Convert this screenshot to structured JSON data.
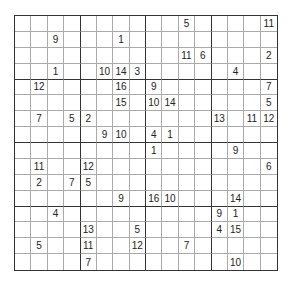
{
  "puzzle": {
    "type": "sudoku-16x16",
    "size": 16,
    "box_size": 4,
    "grid": [
      [
        "",
        "",
        "",
        "",
        "",
        "",
        "",
        "",
        "",
        "",
        "5",
        "",
        "",
        "",
        "",
        "11"
      ],
      [
        "",
        "",
        "9",
        "",
        "",
        "",
        "1",
        "",
        "",
        "",
        "",
        "",
        "",
        "",
        "",
        ""
      ],
      [
        "",
        "",
        "",
        "",
        "",
        "",
        "",
        "",
        "",
        "",
        "11",
        "6",
        "",
        "",
        "",
        "2"
      ],
      [
        "",
        "",
        "1",
        "",
        "",
        "10",
        "14",
        "3",
        "",
        "",
        "",
        "",
        "",
        "4",
        "",
        ""
      ],
      [
        "",
        "12",
        "",
        "",
        "",
        "",
        "16",
        "",
        "9",
        "",
        "",
        "",
        "",
        "",
        "",
        "7"
      ],
      [
        "",
        "",
        "",
        "",
        "",
        "",
        "15",
        "",
        "10",
        "14",
        "",
        "",
        "",
        "",
        "",
        "5"
      ],
      [
        "",
        "7",
        "",
        "5",
        "2",
        "",
        "",
        "",
        "",
        "",
        "",
        "",
        "13",
        "",
        "11",
        "12"
      ],
      [
        "",
        "",
        "",
        "",
        "",
        "9",
        "10",
        "",
        "4",
        "1",
        "",
        "",
        "",
        "",
        "",
        ""
      ],
      [
        "",
        "",
        "",
        "",
        "",
        "",
        "",
        "",
        "1",
        "",
        "",
        "",
        "",
        "9",
        "",
        ""
      ],
      [
        "",
        "11",
        "",
        "",
        "12",
        "",
        "",
        "",
        "",
        "",
        "",
        "",
        "",
        "",
        "",
        "6"
      ],
      [
        "",
        "2",
        "",
        "7",
        "5",
        "",
        "",
        "",
        "",
        "",
        "",
        "",
        "",
        "",
        "",
        ""
      ],
      [
        "",
        "",
        "",
        "",
        "",
        "",
        "9",
        "",
        "16",
        "10",
        "",
        "",
        "",
        "14",
        "",
        ""
      ],
      [
        "",
        "",
        "4",
        "",
        "",
        "",
        "",
        "",
        "",
        "",
        "",
        "",
        "9",
        "1",
        "",
        ""
      ],
      [
        "",
        "",
        "",
        "",
        "13",
        "",
        "",
        "5",
        "",
        "",
        "",
        "",
        "4",
        "15",
        "",
        ""
      ],
      [
        "",
        "5",
        "",
        "",
        "11",
        "",
        "",
        "12",
        "",
        "",
        "7",
        "",
        "",
        "",
        "",
        ""
      ],
      [
        "",
        "",
        "",
        "",
        "7",
        "",
        "",
        "",
        "",
        "",
        "",
        "",
        "",
        "10",
        "",
        ""
      ]
    ]
  }
}
